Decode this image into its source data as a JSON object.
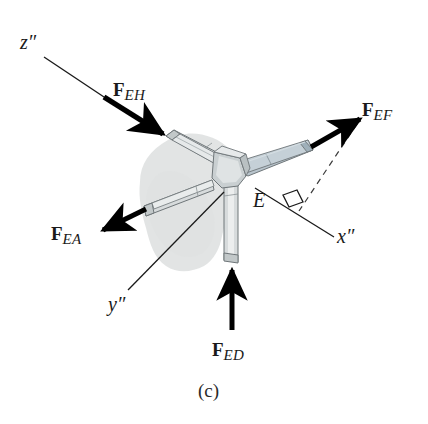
{
  "figure": {
    "caption": "(c)",
    "point_label": "E",
    "background_color": "#ffffff",
    "shadow_color": "#dfe2e2",
    "body_color": "#d7dbdc",
    "body_accent_color": "#b8c4cc",
    "outline_color": "#6f7679",
    "vector_color": "#000000",
    "axis_line_color": "#1a1a1a"
  },
  "axes": [
    {
      "id": "z-axis",
      "name": "z-double-prime",
      "letter": "z",
      "prime": "″",
      "label": "z″",
      "label_x": 20,
      "label_y": 32,
      "line_from": [
        44,
        57
      ],
      "line_to": [
        113,
        103
      ]
    },
    {
      "id": "x-axis",
      "name": "x-double-prime",
      "letter": "x",
      "prime": "″",
      "label": "x″",
      "label_x": 337,
      "label_y": 226,
      "line_from": [
        255,
        188
      ],
      "line_to": [
        334,
        237
      ]
    },
    {
      "id": "y-axis",
      "name": "y-double-prime",
      "letter": "y",
      "prime": "″",
      "label": "y″",
      "label_x": 108,
      "label_y": 294,
      "line_from": [
        128,
        290
      ],
      "line_to": [
        224,
        192
      ]
    }
  ],
  "forces": [
    {
      "id": "F-EH",
      "name": "force-vector-eh",
      "symbol": "F",
      "subscript": "EH",
      "label": "F_EH",
      "label_x": 113,
      "label_y": 80,
      "direction": "down-right",
      "from": [
        104,
        97
      ],
      "to": [
        167,
        137
      ]
    },
    {
      "id": "F-EF",
      "name": "force-vector-ef",
      "symbol": "F",
      "subscript": "EF",
      "label": "F_EF",
      "label_x": 362,
      "label_y": 100,
      "direction": "up-right",
      "from": [
        311,
        147
      ],
      "to": [
        364,
        116
      ]
    },
    {
      "id": "F-EA",
      "name": "force-vector-ea",
      "symbol": "F",
      "subscript": "EA",
      "label": "F_EA",
      "label_x": 51,
      "label_y": 224,
      "direction": "down-left",
      "from": [
        146,
        209
      ],
      "to": [
        98,
        232
      ]
    },
    {
      "id": "F-ED",
      "name": "force-vector-ed",
      "symbol": "F",
      "subscript": "ED",
      "label": "F_ED",
      "label_x": 212,
      "label_y": 340,
      "direction": "up",
      "from": [
        232,
        330
      ],
      "to": [
        232,
        265
      ]
    }
  ],
  "annotations": {
    "right_angle_marker": {
      "name": "right-angle-marker",
      "present": true,
      "x": 291,
      "y": 196
    },
    "projection_dashed_line": {
      "name": "projection-dashed-line",
      "present": true,
      "from": [
        357,
        124
      ],
      "to": [
        299,
        211
      ]
    },
    "point_label_position": {
      "x": 253,
      "y": 190
    },
    "caption_position": {
      "x": 198,
      "y": 381
    }
  },
  "members": [
    {
      "name": "member-upper-left",
      "direction": "upper-left",
      "color": "#d7dbdc"
    },
    {
      "name": "member-right",
      "direction": "right",
      "color": "#b8c4cc"
    },
    {
      "name": "member-left",
      "direction": "left",
      "color": "#d7dbdc"
    },
    {
      "name": "member-down",
      "direction": "down",
      "color": "#d7dbdc"
    },
    {
      "name": "joint-hub",
      "direction": "center",
      "color": "#c9cfd1"
    }
  ]
}
